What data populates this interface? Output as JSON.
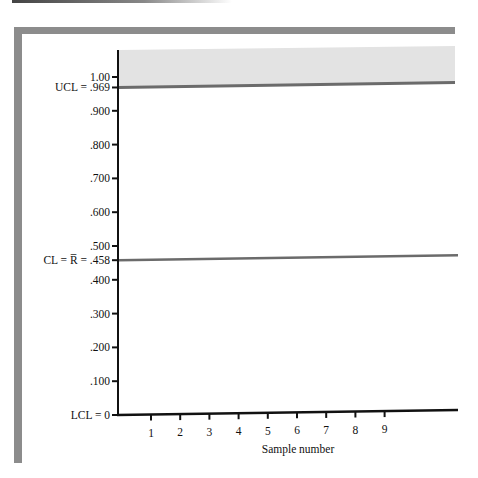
{
  "chart_data": {
    "type": "line",
    "title": "",
    "xlabel": "Sample number",
    "ylabel": "",
    "x_ticks": [
      1,
      2,
      3,
      4,
      5,
      6,
      7,
      8,
      9
    ],
    "xlim": [
      0,
      11.2
    ],
    "ylim": [
      0,
      1.1
    ],
    "y_ticks": [
      {
        "value": 1.0,
        "label": "1.00"
      },
      {
        "value": 0.969,
        "label": "UCL = .969"
      },
      {
        "value": 0.9,
        "label": ".900"
      },
      {
        "value": 0.8,
        "label": ".800"
      },
      {
        "value": 0.7,
        "label": ".700"
      },
      {
        "value": 0.6,
        "label": ".600"
      },
      {
        "value": 0.5,
        "label": ".500"
      },
      {
        "value": 0.458,
        "label": "CL = R̅ = .458"
      },
      {
        "value": 0.4,
        "label": ".400"
      },
      {
        "value": 0.3,
        "label": ".300"
      },
      {
        "value": 0.2,
        "label": ".200"
      },
      {
        "value": 0.1,
        "label": ".100"
      },
      {
        "value": 0.0,
        "label": "LCL = 0"
      }
    ],
    "control_limits": {
      "UCL": 0.969,
      "CL": 0.458,
      "LCL": 0
    },
    "shaded_region": {
      "from": 0.969,
      "to": 1.1,
      "meaning": "out of control (above UCL)"
    },
    "series": [],
    "grid": false,
    "legend": "none"
  },
  "colors": {
    "frame": "#8c8c8c",
    "limit_line": "#6b6b6b",
    "shaded": "#e3e3e3",
    "axis": "#111111"
  }
}
